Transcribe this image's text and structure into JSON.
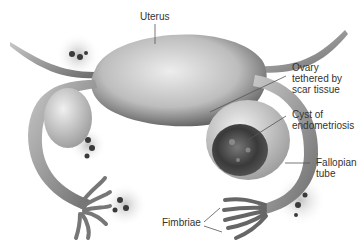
{
  "diagram": {
    "labels": [
      {
        "id": "uterus",
        "text": "Uterus"
      },
      {
        "id": "ovary",
        "text": "Ovary\ntethered by\nscar tissue"
      },
      {
        "id": "cyst",
        "text": "Cyst of\nendometriosis"
      },
      {
        "id": "tube",
        "text": "Fallopian\ntube"
      },
      {
        "id": "fimbriae",
        "text": "Fimbriae"
      }
    ],
    "colors": {
      "tissue_light": "#e6e6e6",
      "tissue_mid": "#a8a8a8",
      "tissue_dark": "#555555",
      "lesion": "#3a3a3a",
      "label_text": "#333333",
      "leader_line": "#555555"
    }
  }
}
